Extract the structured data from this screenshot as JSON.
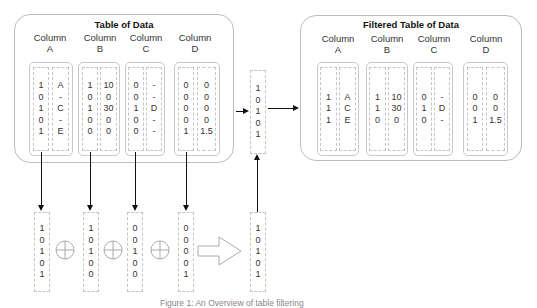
{
  "left_table": {
    "title": "Table of Data",
    "columns": [
      {
        "header_line1": "Column",
        "header_line2": "A",
        "mask": [
          "1",
          "0",
          "1",
          "0",
          "1"
        ],
        "values": [
          "A",
          "-",
          "C",
          "-",
          "E"
        ]
      },
      {
        "header_line1": "Column",
        "header_line2": "B",
        "mask": [
          "1",
          "0",
          "1",
          "0",
          "0"
        ],
        "values": [
          "10",
          "0",
          "30",
          "0",
          "0"
        ]
      },
      {
        "header_line1": "Column",
        "header_line2": "C",
        "mask": [
          "0",
          "0",
          "1",
          "0",
          "0"
        ],
        "values": [
          "-",
          "-",
          "D",
          "-",
          "-"
        ]
      },
      {
        "header_line1": "Column",
        "header_line2": "D",
        "mask": [
          "0",
          "0",
          "0",
          "0",
          "1"
        ],
        "values": [
          "0",
          "0",
          "0",
          "0",
          "1.5"
        ]
      }
    ]
  },
  "mid_vector": [
    "1",
    "0",
    "1",
    "0",
    "1"
  ],
  "right_table": {
    "title": "Filtered Table of Data",
    "columns": [
      {
        "header_line1": "Column",
        "header_line2": "A",
        "mask": [
          "1",
          "1",
          "1"
        ],
        "values": [
          "A",
          "C",
          "E"
        ]
      },
      {
        "header_line1": "Column",
        "header_line2": "B",
        "mask": [
          "1",
          "1",
          "0"
        ],
        "values": [
          "10",
          "30",
          "0"
        ]
      },
      {
        "header_line1": "Column",
        "header_line2": "C",
        "mask": [
          "0",
          "1",
          "0"
        ],
        "values": [
          "-",
          "D",
          "-"
        ]
      },
      {
        "header_line1": "Column",
        "header_line2": "D",
        "mask": [
          "0",
          "0",
          "1"
        ],
        "values": [
          "0",
          "0",
          "1.5"
        ]
      }
    ]
  },
  "bottom_vectors": [
    [
      "1",
      "0",
      "1",
      "0",
      "1"
    ],
    [
      "1",
      "0",
      "1",
      "0",
      "0"
    ],
    [
      "0",
      "0",
      "1",
      "0",
      "0"
    ],
    [
      "0",
      "0",
      "0",
      "0",
      "1"
    ]
  ],
  "result_vector": [
    "1",
    "0",
    "1",
    "0",
    "1"
  ],
  "operator_symbol": "⊕",
  "caption": "Figure 1: An Overview of table filtering"
}
